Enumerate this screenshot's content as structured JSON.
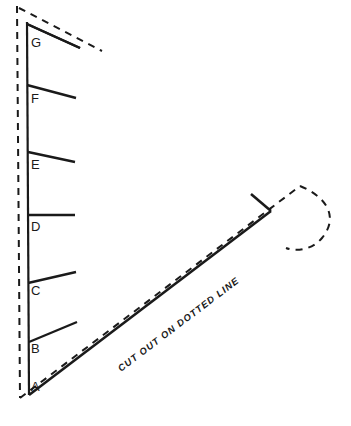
{
  "diagram": {
    "background_color": "#ffffff",
    "line_color": "#1a1a1a",
    "instruction_text": "CUT OUT ON DOTTED LINE",
    "spine": {
      "label": "vertical-left-edge",
      "solid_top": [
        27,
        22
      ],
      "solid_bottom": [
        29,
        395
      ],
      "stroke_width": 2.2
    },
    "cut_line": {
      "label": "dashed-cut-outline",
      "stroke_width": 2.0,
      "dash_pattern": "7 6"
    },
    "rays": [
      {
        "label": "G",
        "label_x": 31,
        "label_y": 44,
        "start_x": 27,
        "start_y": 24,
        "end_x": 80,
        "end_y": 48
      },
      {
        "label": "F",
        "label_x": 31,
        "label_y": 100,
        "start_x": 27,
        "start_y": 85,
        "end_x": 76,
        "end_y": 98
      },
      {
        "label": "E",
        "label_x": 31,
        "label_y": 166,
        "start_x": 28,
        "start_y": 152,
        "end_x": 75,
        "end_y": 162
      },
      {
        "label": "D",
        "label_x": 31,
        "label_y": 228,
        "start_x": 28,
        "start_y": 215,
        "end_x": 75,
        "end_y": 215
      },
      {
        "label": "C",
        "label_x": 31,
        "label_y": 292,
        "start_x": 28,
        "start_y": 283,
        "end_x": 76,
        "end_y": 272
      },
      {
        "label": "B",
        "label_x": 31,
        "label_y": 350,
        "start_x": 29,
        "start_y": 342,
        "end_x": 77,
        "end_y": 322
      },
      {
        "label": "A",
        "label_x": 31,
        "label_y": 388,
        "start_x": 29,
        "start_y": 395,
        "end_x": 271,
        "end_y": 211
      }
    ],
    "apex": {
      "label": "right-apex",
      "x": 271,
      "y": 211,
      "upper_arm_start_x": 251,
      "upper_arm_start_y": 194
    },
    "counts": {
      "ray_count": 7,
      "first_label": "A",
      "last_label": "G"
    }
  }
}
